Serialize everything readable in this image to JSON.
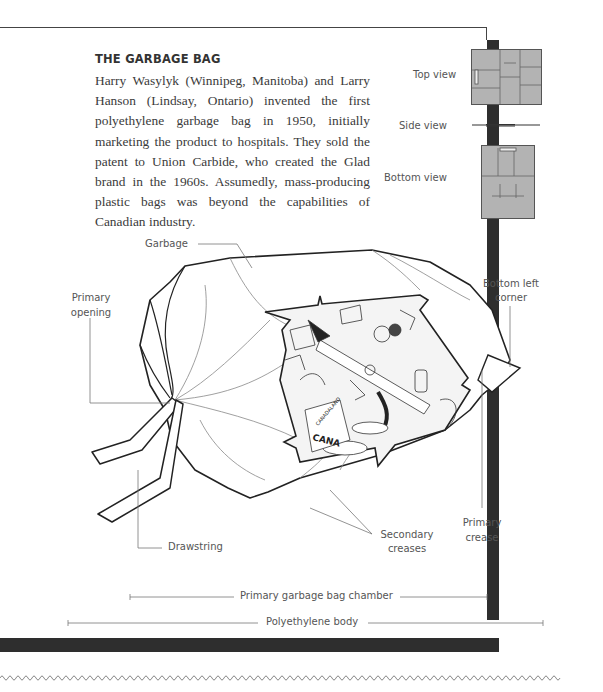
{
  "article": {
    "title": "THE GARBAGE BAG",
    "body": "Harry Wasylyk (Winnipeg, Manitoba) and Larry Hanson (Lindsay, Ontario) invented the first polyethylene garbage bag in 1950, initially marketing the product to hospitals. They sold the patent to Union Carbide, who created the Glad brand in the 1960s. Assumedly, mass-producing plastic bags was beyond the capabilities of Canadian industry."
  },
  "views": {
    "top": "Top view",
    "side": "Side view",
    "bottom": "Bottom view"
  },
  "labels": {
    "garbage": "Garbage",
    "primary_opening_1": "Primary",
    "primary_opening_2": "opening",
    "bottom_left_corner_1": "Bottom left",
    "bottom_left_corner_2": "corner",
    "drawstring": "Drawstring",
    "secondary_creases_1": "Secondary",
    "secondary_creases_2": "creases",
    "primary_crease_1": "Primary",
    "primary_crease_2": "crease",
    "chamber": "Primary garbage bag chamber",
    "body": "Polyethylene body"
  },
  "illustration": {
    "can_text": "CANA",
    "can_small_text": "CANADALAND"
  },
  "colors": {
    "frame_shadow": "#2e2e2e",
    "view_fill": "#b3b3b3",
    "label_text": "#555555",
    "body_text": "#3a3a3a"
  }
}
